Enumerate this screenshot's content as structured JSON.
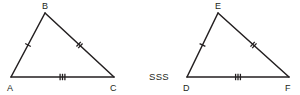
{
  "figure": {
    "type": "geometry-diagram",
    "topic": "congruent-triangles",
    "criterion_label": "SSS",
    "stroke_color": "#231f20",
    "background_color": "#ffffff",
    "triangles": [
      {
        "name": "triangle-abc",
        "vertices": [
          {
            "label": "A",
            "x": 11,
            "y": 77,
            "label_x": 7,
            "label_y": 91
          },
          {
            "label": "B",
            "x": 45,
            "y": 13,
            "label_x": 42,
            "label_y": 9
          },
          {
            "label": "C",
            "x": 114,
            "y": 77,
            "label_x": 110,
            "label_y": 91
          }
        ],
        "sides": [
          {
            "name": "side-ab",
            "from": "A",
            "to": "B",
            "ticks": 1
          },
          {
            "name": "side-bc",
            "from": "B",
            "to": "C",
            "ticks": 2
          },
          {
            "name": "side-ac",
            "from": "A",
            "to": "C",
            "ticks": 3
          }
        ]
      },
      {
        "name": "triangle-def",
        "vertices": [
          {
            "label": "D",
            "x": 187,
            "y": 77,
            "label_x": 183,
            "label_y": 91
          },
          {
            "label": "E",
            "x": 218,
            "y": 13,
            "label_x": 215,
            "label_y": 9
          },
          {
            "label": "F",
            "x": 289,
            "y": 77,
            "label_x": 285,
            "label_y": 91
          }
        ],
        "sides": [
          {
            "name": "side-de",
            "from": "D",
            "to": "E",
            "ticks": 1
          },
          {
            "name": "side-ef",
            "from": "E",
            "to": "F",
            "ticks": 2
          },
          {
            "name": "side-df",
            "from": "D",
            "to": "F",
            "ticks": 3
          }
        ]
      }
    ],
    "criterion": {
      "text": "SSS",
      "x": 149,
      "y": 80
    }
  }
}
